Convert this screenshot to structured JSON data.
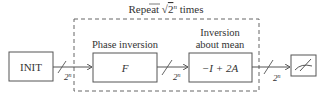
{
  "diagram": {
    "loop_label": "Repeat √2ⁿ times",
    "loop_label_prefix": "Repeat ",
    "loop_label_sqrt": "√",
    "loop_label_base": "2",
    "loop_label_exp": "n",
    "loop_label_suffix": " times",
    "nodes": [
      {
        "id": "init",
        "label": "INIT",
        "title": ""
      },
      {
        "id": "phase",
        "label": "F",
        "title": "Phase inversion"
      },
      {
        "id": "diffusion",
        "label": "−I + 2A",
        "title_line1": "Inversion",
        "title_line2": "about mean"
      },
      {
        "id": "measure",
        "label": "",
        "icon": "meter-icon"
      }
    ],
    "wires": [
      {
        "from": "init",
        "to": "phase",
        "width_base": "2",
        "width_exp": "n"
      },
      {
        "from": "phase",
        "to": "diffusion",
        "width_base": "2",
        "width_exp": "n"
      },
      {
        "from": "diffusion",
        "to": "measure",
        "width_base": "2",
        "width_exp": "n"
      }
    ],
    "colors": {
      "stroke": "#555555",
      "text": "#333333",
      "background": "#ffffff"
    }
  }
}
